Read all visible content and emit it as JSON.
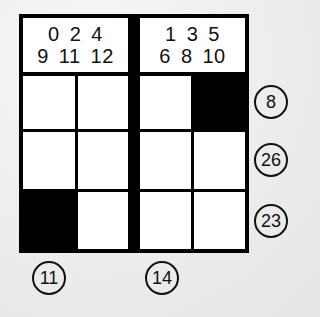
{
  "puzzle": {
    "type": "nonogram-sum-grid",
    "rows": 3,
    "cols": 4,
    "headers": [
      {
        "block": "left",
        "line1": [
          "0",
          "2",
          "4"
        ],
        "line2": [
          "9",
          "11",
          "12"
        ]
      },
      {
        "block": "right",
        "line1": [
          "1",
          "3",
          "5"
        ],
        "line2": [
          "6",
          "8",
          "10"
        ]
      }
    ],
    "cells": [
      [
        "empty",
        "empty",
        "empty",
        "filled"
      ],
      [
        "empty",
        "empty",
        "empty",
        "empty"
      ],
      [
        "filled",
        "empty",
        "empty",
        "empty"
      ]
    ],
    "row_clues": [
      "8",
      "26",
      "23"
    ],
    "column_clues": [
      {
        "col": 1,
        "value": "11"
      },
      {
        "col": 3,
        "value": "14"
      }
    ]
  },
  "colors": {
    "grid_line": "#000000",
    "cell_empty": "#ffffff",
    "cell_filled": "#000000",
    "background": "#efefef"
  }
}
